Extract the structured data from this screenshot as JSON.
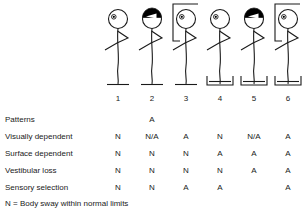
{
  "figures": {
    "count": 6,
    "column_x": [
      118,
      152,
      186,
      220,
      254,
      288
    ],
    "items": [
      {
        "number": "1",
        "eyes": "open",
        "blindfold": false,
        "surround_box": false,
        "surface": "firm",
        "data_name": "stick-figure-1"
      },
      {
        "number": "2",
        "eyes": "blindfolded",
        "blindfold": true,
        "surround_box": false,
        "surface": "firm",
        "data_name": "stick-figure-2"
      },
      {
        "number": "3",
        "eyes": "open",
        "blindfold": false,
        "surround_box": true,
        "surface": "firm",
        "data_name": "stick-figure-3"
      },
      {
        "number": "4",
        "eyes": "open",
        "blindfold": false,
        "surround_box": false,
        "surface": "moving-platform",
        "data_name": "stick-figure-4"
      },
      {
        "number": "5",
        "eyes": "blindfolded",
        "blindfold": true,
        "surround_box": false,
        "surface": "moving-platform",
        "data_name": "stick-figure-5"
      },
      {
        "number": "6",
        "eyes": "open",
        "blindfold": false,
        "surround_box": true,
        "surface": "moving-platform",
        "data_name": "stick-figure-6"
      }
    ]
  },
  "table": {
    "rows": [
      {
        "label": "Patterns",
        "values": [
          "",
          "A",
          "",
          "",
          "",
          ""
        ]
      },
      {
        "label": "Visually dependent",
        "values": [
          "N",
          "N/A",
          "A",
          "N",
          "N/A",
          "A"
        ]
      },
      {
        "label": "Surface dependent",
        "values": [
          "N",
          "N",
          "N",
          "A",
          "A",
          "A"
        ]
      },
      {
        "label": "Vestibular loss",
        "values": [
          "N",
          "N",
          "N",
          "N",
          "A",
          "A"
        ]
      },
      {
        "label": "Sensory selection",
        "values": [
          "N",
          "N",
          "A",
          "A",
          "",
          "A"
        ]
      }
    ],
    "row_labels": {
      "patterns": "Patterns",
      "visually_dependent": "Visually dependent",
      "surface_dependent": "Surface dependent",
      "vestibular_loss": "Vestibular loss",
      "sensory_selection": "Sensory selection"
    }
  },
  "footnote": "N = Body sway within normal limits",
  "colors": {
    "ink": "#1a1a1a",
    "background": "#ffffff",
    "blindfold": "#000000"
  }
}
